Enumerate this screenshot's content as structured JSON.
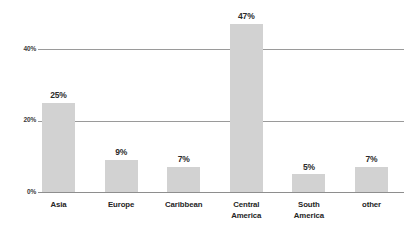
{
  "chart_data": {
    "type": "bar",
    "title": "",
    "xlabel": "",
    "ylabel": "",
    "categories": [
      "Asia",
      "Europe",
      "Caribbean",
      "Central America",
      "South America",
      "other"
    ],
    "values": [
      25,
      9,
      7,
      47,
      5,
      7
    ],
    "value_labels": [
      "25%",
      "9%",
      "7%",
      "47%",
      "5%",
      "7%"
    ],
    "ylim": [
      0,
      47
    ],
    "y_ticks": [
      0,
      20,
      40
    ],
    "y_tick_labels": [
      "0%",
      "20%",
      "40%"
    ],
    "grid": true,
    "legend": "none",
    "series": [
      {
        "name": "share",
        "values": [
          25,
          9,
          7,
          47,
          5,
          7
        ]
      }
    ]
  },
  "axis": {
    "y_ticks": [
      {
        "label": "40%",
        "value": 40
      },
      {
        "label": "20%",
        "value": 20
      },
      {
        "label": "0%",
        "value": 0
      }
    ]
  },
  "bars": [
    {
      "category": "Asia",
      "category_display": "Asia",
      "value": 25,
      "label": "25%"
    },
    {
      "category": "Europe",
      "category_display": "Europe",
      "value": 9,
      "label": "9%"
    },
    {
      "category": "Caribbean",
      "category_display": "Caribbean",
      "value": 7,
      "label": "7%"
    },
    {
      "category": "Central America",
      "category_display": "Central\nAmerica",
      "value": 47,
      "label": "47%"
    },
    {
      "category": "South America",
      "category_display": "South\nAmerica",
      "value": 5,
      "label": "5%"
    },
    {
      "category": "other",
      "category_display": "other",
      "value": 7,
      "label": "7%"
    }
  ],
  "colors": {
    "bar_fill": "#d2d2d2",
    "grid_line": "#9a9a9a",
    "axis_line": "#8e8e8e",
    "text": "#242424",
    "background": "#ffffff"
  }
}
